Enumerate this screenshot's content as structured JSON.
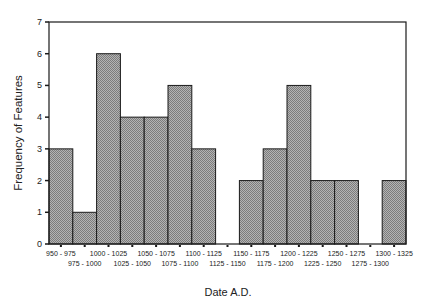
{
  "chart_data": {
    "type": "bar",
    "title": "",
    "xlabel": "Date A.D.",
    "ylabel": "Frequency of Features",
    "ylim": [
      0,
      7
    ],
    "yticks": [
      0,
      1,
      2,
      3,
      4,
      5,
      6,
      7
    ],
    "grid": false,
    "legend": null,
    "categories": [
      "950 - 975",
      "975 - 1000",
      "1000 - 1025",
      "1025 - 1050",
      "1050 - 1075",
      "1075 - 1100",
      "1100 - 1125",
      "1125 - 1150",
      "1150 - 1175",
      "1175 - 1200",
      "1200 - 1225",
      "1225 - 1250",
      "1250 - 1275",
      "1275 - 1300",
      "1300 - 1325"
    ],
    "values": [
      3,
      1,
      6,
      4,
      4,
      5,
      3,
      0,
      2,
      3,
      5,
      2,
      2,
      0,
      2
    ],
    "bar_fill": "#9c9c9c",
    "bar_edge": "#1a1a1a"
  }
}
